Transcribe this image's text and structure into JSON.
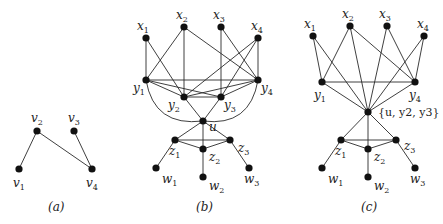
{
  "panels": [
    {
      "id": "a",
      "caption": "(a)",
      "nodes": [
        {
          "id": "v1",
          "label": "v",
          "sub": "1",
          "x": 19,
          "y": 169
        },
        {
          "id": "v2",
          "label": "v",
          "sub": "2",
          "x": 37,
          "y": 131
        },
        {
          "id": "v3",
          "label": "v",
          "sub": "3",
          "x": 74,
          "y": 131
        },
        {
          "id": "v4",
          "label": "v",
          "sub": "4",
          "x": 92,
          "y": 169
        }
      ],
      "edges": [
        [
          "v1",
          "v2"
        ],
        [
          "v2",
          "v4"
        ],
        [
          "v3",
          "v4"
        ]
      ]
    },
    {
      "id": "b",
      "caption": "(b)",
      "nodes": [
        {
          "id": "x1",
          "label": "x",
          "sub": "1",
          "x": 146,
          "y": 38
        },
        {
          "id": "x2",
          "label": "x",
          "sub": "2",
          "x": 184,
          "y": 27
        },
        {
          "id": "x3",
          "label": "x",
          "sub": "3",
          "x": 221,
          "y": 27
        },
        {
          "id": "x4",
          "label": "x",
          "sub": "4",
          "x": 258,
          "y": 38
        },
        {
          "id": "y1",
          "label": "y",
          "sub": "1",
          "x": 146,
          "y": 80
        },
        {
          "id": "y2",
          "label": "y",
          "sub": "2",
          "x": 184,
          "y": 97
        },
        {
          "id": "y3",
          "label": "y",
          "sub": "3",
          "x": 221,
          "y": 97
        },
        {
          "id": "y4",
          "label": "y",
          "sub": "4",
          "x": 258,
          "y": 80
        },
        {
          "id": "u",
          "label": "u",
          "sub": "",
          "x": 203,
          "y": 121
        },
        {
          "id": "z1",
          "label": "z",
          "sub": "1",
          "x": 175,
          "y": 140
        },
        {
          "id": "z2",
          "label": "z",
          "sub": "2",
          "x": 203,
          "y": 149
        },
        {
          "id": "z3",
          "label": "z",
          "sub": "3",
          "x": 230,
          "y": 140
        },
        {
          "id": "w1",
          "label": "w",
          "sub": "1",
          "x": 156,
          "y": 168
        },
        {
          "id": "w2",
          "label": "w",
          "sub": "2",
          "x": 203,
          "y": 177
        },
        {
          "id": "w3",
          "label": "w",
          "sub": "3",
          "x": 249,
          "y": 168
        }
      ],
      "edges": [
        [
          "x1",
          "y1"
        ],
        [
          "x1",
          "y2"
        ],
        [
          "x2",
          "y1"
        ],
        [
          "x2",
          "y2"
        ],
        [
          "x2",
          "y4"
        ],
        [
          "x3",
          "y3"
        ],
        [
          "x3",
          "y4"
        ],
        [
          "x4",
          "y2"
        ],
        [
          "x4",
          "y3"
        ],
        [
          "x4",
          "y4"
        ],
        [
          "y1",
          "y4"
        ],
        [
          "y1",
          "y2"
        ],
        [
          "y1",
          "y3"
        ],
        [
          "y2",
          "y3"
        ],
        [
          "y2",
          "y4"
        ],
        [
          "y3",
          "y4"
        ],
        [
          "y2",
          "u"
        ],
        [
          "y3",
          "u"
        ],
        [
          "u",
          "z1"
        ],
        [
          "u",
          "z2"
        ],
        [
          "u",
          "z3"
        ],
        [
          "z1",
          "z2"
        ],
        [
          "z2",
          "z3"
        ],
        [
          "z1",
          "z3"
        ],
        [
          "z1",
          "w1"
        ],
        [
          "z2",
          "w2"
        ],
        [
          "z3",
          "w3"
        ]
      ],
      "curved_edges": [
        [
          "y1",
          "u"
        ],
        [
          "y4",
          "u"
        ]
      ]
    },
    {
      "id": "c",
      "caption": "(c)",
      "nodes": [
        {
          "id": "x1",
          "label": "x",
          "sub": "1",
          "x": 313,
          "y": 36
        },
        {
          "id": "x2",
          "label": "x",
          "sub": "2",
          "x": 350,
          "y": 26
        },
        {
          "id": "x3",
          "label": "x",
          "sub": "3",
          "x": 387,
          "y": 26
        },
        {
          "id": "x4",
          "label": "x",
          "sub": "4",
          "x": 424,
          "y": 36
        },
        {
          "id": "y1",
          "label": "y",
          "sub": "1",
          "x": 322,
          "y": 82
        },
        {
          "id": "y4",
          "label": "y",
          "sub": "4",
          "x": 415,
          "y": 82
        },
        {
          "id": "m",
          "label": "{u, y2, y3}",
          "sub": "",
          "x": 368,
          "y": 112
        },
        {
          "id": "z1",
          "label": "z",
          "sub": "1",
          "x": 341,
          "y": 140
        },
        {
          "id": "z2",
          "label": "z",
          "sub": "2",
          "x": 368,
          "y": 149
        },
        {
          "id": "z3",
          "label": "z",
          "sub": "3",
          "x": 396,
          "y": 140
        },
        {
          "id": "w1",
          "label": "w",
          "sub": "1",
          "x": 322,
          "y": 168
        },
        {
          "id": "w2",
          "label": "w",
          "sub": "2",
          "x": 368,
          "y": 177
        },
        {
          "id": "w3",
          "label": "w",
          "sub": "3",
          "x": 415,
          "y": 168
        }
      ],
      "edges": [
        [
          "x1",
          "y1"
        ],
        [
          "x1",
          "m"
        ],
        [
          "x2",
          "y1"
        ],
        [
          "x2",
          "m"
        ],
        [
          "x2",
          "y4"
        ],
        [
          "x3",
          "m"
        ],
        [
          "x3",
          "y4"
        ],
        [
          "x4",
          "m"
        ],
        [
          "x4",
          "y4"
        ],
        [
          "y1",
          "y4"
        ],
        [
          "y1",
          "m"
        ],
        [
          "y4",
          "m"
        ],
        [
          "m",
          "z1"
        ],
        [
          "m",
          "z2"
        ],
        [
          "m",
          "z3"
        ],
        [
          "z1",
          "z2"
        ],
        [
          "z2",
          "z3"
        ],
        [
          "z1",
          "z3"
        ],
        [
          "z1",
          "w1"
        ],
        [
          "z2",
          "w2"
        ],
        [
          "z3",
          "w3"
        ]
      ]
    }
  ]
}
